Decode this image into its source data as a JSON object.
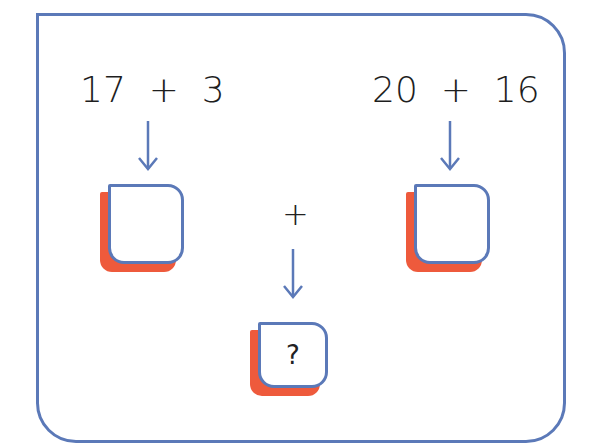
{
  "diagram": {
    "left_expression": "17  +  3",
    "right_expression": "20  +  16",
    "middle_operator": "+",
    "left_box_value": "",
    "right_box_value": "",
    "result_box_value": "?",
    "colors": {
      "frame": "#5b79b8",
      "arrow": "#5b79b8",
      "box_border": "#5b79b8",
      "box_shadow": "#ee5a3c",
      "text": "#1e1e1e"
    },
    "icons": [
      "arrow-down-icon",
      "arrow-down-icon",
      "arrow-down-icon"
    ]
  }
}
